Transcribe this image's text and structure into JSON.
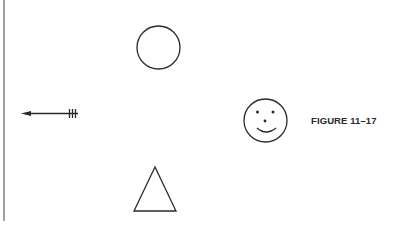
{
  "figure": {
    "label": "FIGURE 11–17",
    "ink_color": "#2a2a2a",
    "background": "#ffffff"
  },
  "shapes": [
    {
      "name": "vertical-margin-line"
    },
    {
      "name": "circle"
    },
    {
      "name": "arrow-left-with-fletching"
    },
    {
      "name": "smiley-face"
    },
    {
      "name": "triangle"
    }
  ]
}
